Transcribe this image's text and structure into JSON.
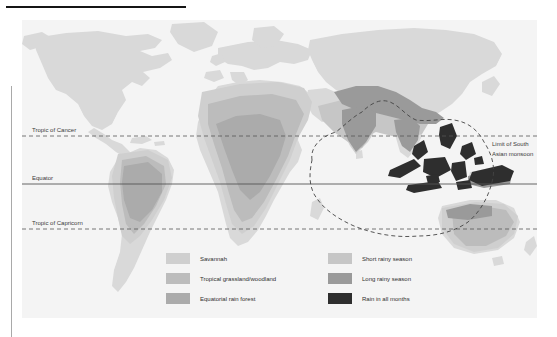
{
  "figure": {
    "kind": "world-climate-map",
    "title_rule": true
  },
  "map": {
    "background_color": "#f2f2f2",
    "ocean_color": "#f4f4f4",
    "land_color": "#d9d9d9",
    "graticule": {
      "lines": [
        {
          "name": "tropic-of-cancer",
          "label": "Tropic of Cancer",
          "style": "dashed",
          "y": 116
        },
        {
          "name": "equator",
          "label": "Equator",
          "style": "solid",
          "y": 164
        },
        {
          "name": "tropic-of-capricorn",
          "label": "Tropic of Capricorn",
          "style": "dashed",
          "y": 209
        }
      ]
    },
    "annotations": [
      {
        "name": "monsoon-limit",
        "label_line_1": "Limit of South",
        "label_line_2": "Asian monsoon",
        "style": "dashed-outline"
      }
    ]
  },
  "legend": {
    "left_column": [
      {
        "label": "Savannah",
        "color": "#cfcfcf"
      },
      {
        "label": "Tropical grassland/woodland",
        "color": "#bcbcbc"
      },
      {
        "label": "Equatorial rain forest",
        "color": "#ababab"
      }
    ],
    "right_column": [
      {
        "label": "Short rainy season",
        "color": "#c6c6c6"
      },
      {
        "label": "Long rainy season",
        "color": "#9a9a9a"
      },
      {
        "label": "Rain in all months",
        "color": "#2e2e2e"
      }
    ]
  },
  "colors": {
    "rule": "#151515",
    "side_rule": "#a9a9a9",
    "text": "#3a3a3a",
    "graticule": "#555555"
  }
}
